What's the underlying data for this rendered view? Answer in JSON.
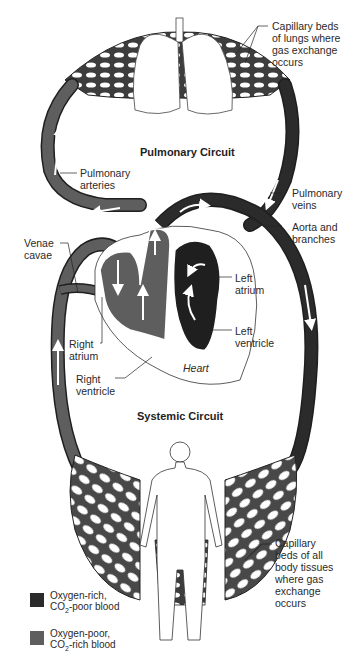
{
  "titles": {
    "pulmonary": "Pulmonary Circuit",
    "systemic": "Systemic Circuit",
    "heart": "Heart"
  },
  "labels": {
    "capillary_lungs": "Capillary beds\nof lungs where\ngas exchange\noccurs",
    "pulmonary_arteries": "Pulmonary\narteries",
    "pulmonary_veins": "Pulmonary\nveins",
    "aorta": "Aorta and\nbranches",
    "venae_cavae": "Venae\ncavae",
    "left_atrium": "Left\natrium",
    "left_ventricle": "Left\nventricle",
    "right_atrium": "Right\natrium",
    "right_ventricle": "Right\nventricle",
    "capillary_body": "Capillary\nbeds of all\nbody tissues\nwhere gas\nexchange\noccurs"
  },
  "legend": [
    {
      "line1": "Oxygen-rich,",
      "line2_prefix": "CO",
      "line2_sub": "2",
      "line2_suffix": "-poor blood",
      "color": "#2b2b2b"
    },
    {
      "line1": "Oxygen-poor,",
      "line2_prefix": "CO",
      "line2_sub": "2",
      "line2_suffix": "-rich blood",
      "color": "#5e5e5e"
    }
  ],
  "colors": {
    "oxygen_rich": "#2b2b2b",
    "oxygen_poor": "#5e5e5e",
    "vessel_outline": "#1f1f1f",
    "arrow": "#ffffff"
  }
}
